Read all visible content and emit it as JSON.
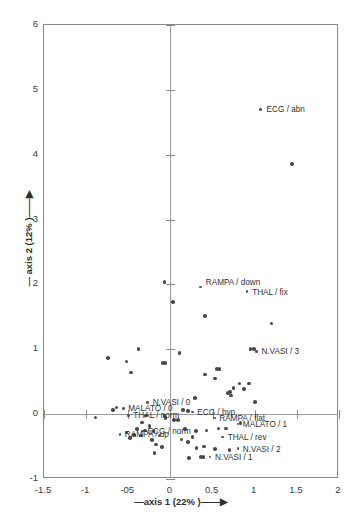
{
  "chart_data": {
    "type": "scatter",
    "title": "",
    "xlabel": "—axis 1 (22% )——▶",
    "ylabel": "— axis 2 (12% )——▶",
    "xlim": [
      -1.5,
      2
    ],
    "ylim": [
      -1,
      6
    ],
    "xticks": [
      "-1.5",
      "-1",
      "-05",
      "0",
      "0.5",
      "1",
      "1.5",
      "2"
    ],
    "xtick_values": [
      -1.5,
      -1,
      -0.5,
      0,
      0.5,
      1,
      1.5,
      2
    ],
    "yticks": [
      "-1",
      "0",
      "1",
      "2",
      "3",
      "4",
      "5",
      "6"
    ],
    "ytick_values": [
      -1,
      0,
      1,
      2,
      3,
      4,
      5,
      6
    ],
    "grid": false,
    "legend": "none",
    "point_color": "#4a4a4a",
    "axis_color": "#8a8a8a",
    "labeled_points": [
      {
        "label": "ECG / abn",
        "x": 1.07,
        "y": 4.7,
        "lx": 6,
        "ly": -4
      },
      {
        "label": "RAMPA / down",
        "x": 0.36,
        "y": 1.96,
        "lx": 5,
        "ly": -9
      },
      {
        "label": "THAL / fix",
        "x": 0.91,
        "y": 1.89,
        "lx": 5,
        "ly": -4
      },
      {
        "label": "N.VASI / 3",
        "x": 1.02,
        "y": 0.97,
        "lx": 5,
        "ly": -4
      },
      {
        "label": "N.VASI / 0",
        "x": -0.27,
        "y": 0.18,
        "lx": 5,
        "ly": -4
      },
      {
        "label": "MALATO / 0",
        "x": -0.56,
        "y": 0.09,
        "lx": 5,
        "ly": -4
      },
      {
        "label": "THAL / norm",
        "x": -0.5,
        "y": -0.02,
        "lx": 5,
        "ly": -4
      },
      {
        "label": "ECG / hyp",
        "x": 0.26,
        "y": 0.03,
        "lx": 5,
        "ly": -4
      },
      {
        "label": "ECG / norm",
        "x": -0.33,
        "y": -0.26,
        "lx": 5,
        "ly": -4
      },
      {
        "label": "RAMPA / up",
        "x": -0.6,
        "y": -0.31,
        "lx": 5,
        "ly": -4
      },
      {
        "label": "RAMPA / flat",
        "x": 0.52,
        "y": -0.06,
        "lx": 5,
        "ly": -4
      },
      {
        "label": "MALATO / 1",
        "x": 0.8,
        "y": -0.15,
        "lx": 5,
        "ly": -4
      },
      {
        "label": "THAL / rev",
        "x": 0.62,
        "y": -0.35,
        "lx": 5,
        "ly": -4
      },
      {
        "label": "N.VASI / 2",
        "x": 0.8,
        "y": -0.53,
        "lx": 5,
        "ly": -4
      },
      {
        "label": "N.VASI / 1",
        "x": 0.47,
        "y": -0.66,
        "lx": 5,
        "ly": -4
      }
    ],
    "unlabeled_points": [
      {
        "x": 1.44,
        "y": 3.86
      },
      {
        "x": -0.07,
        "y": 2.04
      },
      {
        "x": 0.03,
        "y": 1.73
      },
      {
        "x": 0.41,
        "y": 1.51
      },
      {
        "x": 1.2,
        "y": 1.4
      },
      {
        "x": 0.95,
        "y": 1.0
      },
      {
        "x": 0.99,
        "y": 1.0
      },
      {
        "x": -0.38,
        "y": 1.0
      },
      {
        "x": 0.11,
        "y": 0.94
      },
      {
        "x": -0.74,
        "y": 0.87
      },
      {
        "x": -0.52,
        "y": 0.81
      },
      {
        "x": -0.09,
        "y": 0.79
      },
      {
        "x": -0.06,
        "y": 0.79
      },
      {
        "x": 0.55,
        "y": 0.7
      },
      {
        "x": 0.58,
        "y": 0.7
      },
      {
        "x": -0.47,
        "y": 0.64
      },
      {
        "x": 0.41,
        "y": 0.61
      },
      {
        "x": 0.53,
        "y": 0.55
      },
      {
        "x": 0.82,
        "y": 0.47
      },
      {
        "x": 0.93,
        "y": 0.47
      },
      {
        "x": 0.75,
        "y": 0.4
      },
      {
        "x": 0.87,
        "y": 0.39
      },
      {
        "x": 0.68,
        "y": 0.33
      },
      {
        "x": 0.71,
        "y": 0.34
      },
      {
        "x": 0.72,
        "y": 0.29
      },
      {
        "x": 0.29,
        "y": 0.25
      },
      {
        "x": 1.0,
        "y": 0.19
      },
      {
        "x": -0.64,
        "y": 0.1
      },
      {
        "x": -0.68,
        "y": 0.06
      },
      {
        "x": 0.15,
        "y": 0.06
      },
      {
        "x": 0.21,
        "y": 0.05
      },
      {
        "x": -0.89,
        "y": -0.05
      },
      {
        "x": -0.29,
        "y": -0.02
      },
      {
        "x": -0.07,
        "y": -0.03
      },
      {
        "x": -0.06,
        "y": -0.06
      },
      {
        "x": 0.04,
        "y": -0.09
      },
      {
        "x": 0.09,
        "y": -0.09
      },
      {
        "x": -0.34,
        "y": -0.13
      },
      {
        "x": -0.25,
        "y": -0.18
      },
      {
        "x": 0.83,
        "y": -0.14
      },
      {
        "x": -0.4,
        "y": -0.23
      },
      {
        "x": -0.3,
        "y": -0.25
      },
      {
        "x": -0.2,
        "y": -0.26
      },
      {
        "x": 0.17,
        "y": -0.23
      },
      {
        "x": 0.3,
        "y": -0.26
      },
      {
        "x": 0.43,
        "y": -0.25
      },
      {
        "x": 0.57,
        "y": -0.22
      },
      {
        "x": 0.66,
        "y": -0.22
      },
      {
        "x": -0.52,
        "y": -0.28
      },
      {
        "x": -0.43,
        "y": -0.32
      },
      {
        "x": -0.35,
        "y": -0.33
      },
      {
        "x": -0.13,
        "y": -0.33
      },
      {
        "x": 0.26,
        "y": -0.35
      },
      {
        "x": -0.48,
        "y": -0.37
      },
      {
        "x": -0.22,
        "y": -0.4
      },
      {
        "x": 0.13,
        "y": -0.39
      },
      {
        "x": 0.21,
        "y": -0.43
      },
      {
        "x": -0.17,
        "y": -0.47
      },
      {
        "x": -0.1,
        "y": -0.51
      },
      {
        "x": -0.19,
        "y": -0.6
      },
      {
        "x": 0.31,
        "y": -0.52
      },
      {
        "x": 0.4,
        "y": -0.5
      },
      {
        "x": 0.53,
        "y": -0.54
      },
      {
        "x": 0.7,
        "y": -0.55
      },
      {
        "x": 0.22,
        "y": -0.68
      },
      {
        "x": 0.36,
        "y": -0.66
      },
      {
        "x": 0.39,
        "y": -0.66
      }
    ]
  }
}
